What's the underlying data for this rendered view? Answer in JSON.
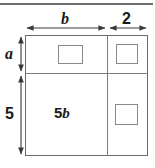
{
  "figure": {
    "top_rule": "horizontal-rule",
    "dimensions": {
      "top": [
        {
          "label": "b",
          "style": "italic-variable",
          "name": "width-b"
        },
        {
          "label": "2",
          "style": "upright-number",
          "name": "width-2"
        }
      ],
      "left": [
        {
          "label": "a",
          "style": "italic-variable",
          "name": "height-a"
        },
        {
          "label": "5",
          "style": "upright-number",
          "name": "height-5"
        }
      ]
    },
    "regions": [
      {
        "name": "top-left-region",
        "label": "",
        "inner_square": true
      },
      {
        "name": "top-right-region",
        "label": "",
        "inner_square": true
      },
      {
        "name": "bottom-left-region",
        "label_number": "5",
        "label_variable": "b",
        "inner_square": false
      },
      {
        "name": "bottom-right-region",
        "label": "",
        "inner_square": true
      }
    ],
    "area_label": {
      "number": "5",
      "variable": "b"
    },
    "colors": {
      "stroke": "#6b6b6b",
      "inner_stroke": "#8a8a8a",
      "divider": "#7a7a7a",
      "rule": "#6e6e6e",
      "text": "#1a1a1a",
      "background": "#ffffff"
    }
  }
}
